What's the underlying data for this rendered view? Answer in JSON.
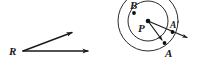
{
  "figure": {
    "background_color": "#ffffff",
    "ink_color": "#1a1a1a",
    "width": 199,
    "height": 68
  },
  "left_figure": {
    "name": "angle-r",
    "description": "An angle with vertex R formed by two rays with arrowheads",
    "vertex_label": "R",
    "vertex": {
      "x": 23,
      "y": 51
    },
    "rays": [
      {
        "name": "upper-ray",
        "from": {
          "x": 23,
          "y": 51
        },
        "to": {
          "x": 76,
          "y": 31
        },
        "arrowhead": true
      },
      {
        "name": "lower-ray",
        "from": {
          "x": 23,
          "y": 51
        },
        "to": {
          "x": 93,
          "y": 51
        },
        "arrowhead": true
      }
    ],
    "label_position": {
      "x": 9,
      "y": 55
    }
  },
  "right_figure": {
    "name": "rotation-about-p",
    "description": "Two concentric circles centered at P with points A, A prime and B, plus rotation rays",
    "center": {
      "x": 148,
      "y": 21
    },
    "center_label": "P",
    "center_label_position": {
      "x": 139,
      "y": 31
    },
    "circles": [
      {
        "name": "outer-circle",
        "radius": 30
      },
      {
        "name": "inner-circle",
        "radius": 20
      }
    ],
    "points": [
      {
        "name": "point-b",
        "label": "B",
        "x": 134,
        "y": 13,
        "label_position": {
          "x": 130,
          "y": 9
        }
      },
      {
        "name": "point-a",
        "label": "A",
        "x": 164,
        "y": 43,
        "label_position": {
          "x": 166,
          "y": 56
        }
      },
      {
        "name": "point-a-prime",
        "label": "A'",
        "x": 173,
        "y": 32,
        "label_position": {
          "x": 172,
          "y": 27
        }
      }
    ],
    "rays": [
      {
        "name": "ray-p-to-a",
        "from": {
          "x": 148,
          "y": 21
        },
        "to": {
          "x": 166,
          "y": 45
        },
        "arrowhead": true
      },
      {
        "name": "ray-p-to-a-prime",
        "from": {
          "x": 148,
          "y": 21
        },
        "to": {
          "x": 191,
          "y": 39
        },
        "arrowhead": true
      }
    ]
  }
}
